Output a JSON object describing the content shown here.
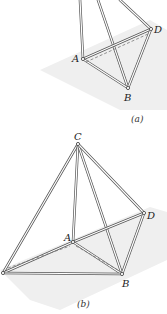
{
  "figure_a": {
    "caption": "(a)",
    "labels": {
      "A": "A",
      "B": "B",
      "D": "D"
    },
    "points": {
      "A": [
        83,
        59
      ],
      "B": [
        128,
        88
      ],
      "D": [
        151,
        29
      ],
      "topL": [
        80,
        0
      ],
      "topM": [
        98,
        0
      ],
      "topR": [
        120,
        0
      ]
    }
  },
  "figure_b": {
    "caption": "(b)",
    "labels": {
      "A": "A",
      "B": "B",
      "C": "C",
      "D": "D"
    },
    "points": {
      "C": [
        78,
        144
      ],
      "D": [
        144,
        213
      ],
      "A": [
        73,
        242
      ],
      "B": [
        122,
        274
      ],
      "E": [
        3,
        273
      ]
    }
  },
  "colors": {
    "rod": "#555555",
    "plane": "#ececec",
    "background": "#ffffff"
  }
}
